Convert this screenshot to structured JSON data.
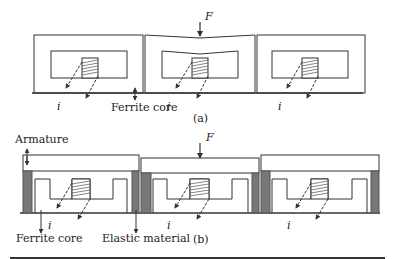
{
  "figure": {
    "panel_a": {
      "caption": "(a)",
      "force_label": "F",
      "current_label": "i",
      "core_label": "Ferrite core"
    },
    "panel_b": {
      "caption": "(b)",
      "force_label": "F",
      "current_label": "i",
      "armature_label": "Armature",
      "core_label": "Ferrite core",
      "elastic_label": "Elastic material"
    },
    "colors": {
      "line": "#333333",
      "elastic_fill": "#777777",
      "background": "#ffffff"
    }
  }
}
